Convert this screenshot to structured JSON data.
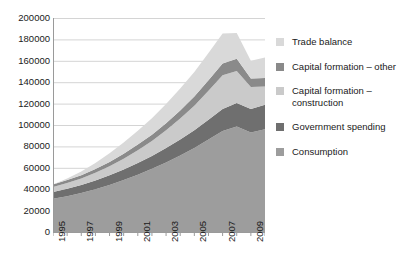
{
  "chart_data": {
    "type": "area",
    "stacked": true,
    "title": "",
    "xlabel": "",
    "ylabel": "",
    "grid": true,
    "legend_position": "right",
    "ylim": [
      0,
      200000
    ],
    "ytick_step": 20000,
    "yticks": [
      "200000",
      "180000",
      "160000",
      "140000",
      "120000",
      "100000",
      "80000",
      "60000",
      "40000",
      "20000",
      "0"
    ],
    "x": [
      1995,
      1996,
      1997,
      1998,
      1999,
      2000,
      2001,
      2002,
      2003,
      2004,
      2005,
      2006,
      2007,
      2008,
      2009,
      2010
    ],
    "xticks_labeled": [
      "1995",
      "1997",
      "1999",
      "2001",
      "2003",
      "2005",
      "2007",
      "2009"
    ],
    "xlim": [
      1995,
      2010
    ],
    "series": [
      {
        "name": "Consumption",
        "color": "#9d9d9d",
        "values": [
          31000,
          33500,
          36500,
          40000,
          44000,
          48500,
          53500,
          59000,
          65000,
          71500,
          78500,
          86500,
          94500,
          98500,
          93000,
          96000
        ]
      },
      {
        "name": "Government spending",
        "color": "#6f6f6f",
        "values": [
          6500,
          7000,
          7500,
          8200,
          9000,
          10000,
          11000,
          12000,
          13500,
          15000,
          16500,
          18500,
          20500,
          22000,
          22000,
          23000
        ]
      },
      {
        "name": "Capital formation – construction",
        "color": "#cacaca",
        "values": [
          4500,
          5200,
          6000,
          7200,
          8500,
          10000,
          12000,
          14000,
          16500,
          19500,
          23000,
          27000,
          31500,
          30000,
          20500,
          17000
        ]
      },
      {
        "name": "Capital formation – other",
        "color": "#8a8a8a",
        "values": [
          2500,
          2800,
          3100,
          3500,
          4000,
          4600,
          5200,
          5900,
          6700,
          7600,
          8600,
          9800,
          11000,
          11500,
          8000,
          8000
        ]
      },
      {
        "name": "Trade balance",
        "color": "#d9d9d9",
        "values": [
          0,
          1500,
          3500,
          5500,
          8000,
          10500,
          13000,
          15500,
          18000,
          20500,
          23000,
          25500,
          28000,
          24000,
          16500,
          19000
        ]
      }
    ],
    "totals": [
      44500,
      50000,
      56600,
      64400,
      73500,
      83600,
      94700,
      106400,
      119700,
      134100,
      149600,
      167300,
      185500,
      186000,
      160000,
      163000
    ]
  },
  "legend": {
    "items": [
      {
        "label": "Trade balance",
        "color": "#d9d9d9"
      },
      {
        "label": "Capital formation – other",
        "color": "#8a8a8a"
      },
      {
        "label": "Capital formation – construction",
        "color": "#cacaca"
      },
      {
        "label": "Government spending",
        "color": "#6f6f6f"
      },
      {
        "label": "Consumption",
        "color": "#9d9d9d"
      }
    ]
  },
  "axis": {
    "gridline_color": "#d4d4d4",
    "axis_color": "#9a9a9a",
    "text_color": "#1a1a1a"
  }
}
